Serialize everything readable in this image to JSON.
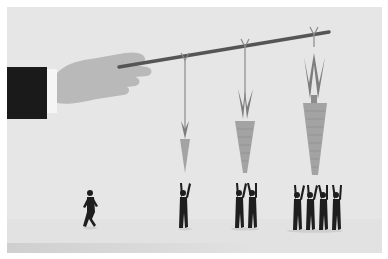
{
  "illustration": {
    "description": "Hand holding a stick with three carrots of increasing size dangling from strings; groups of 1, 2, and 4 businessmen reach up toward them while one man walks alone",
    "colors": {
      "background": "#e6e6e6",
      "floor": "#e2e2e2",
      "sleeve": "#1a1a1a",
      "cuff": "#f5f5f5",
      "hand": "#b9b9b9",
      "stick": "#555555",
      "string": "#8a8a8a",
      "carrot": "#a3a3a3",
      "carrot_leaves": "#7d7d7d",
      "figures": "#1e1e1e"
    },
    "carrots": [
      {
        "size": "small",
        "people_reaching": 1
      },
      {
        "size": "medium",
        "people_reaching": 2
      },
      {
        "size": "large",
        "people_reaching": 4
      }
    ],
    "walking_figures": 1
  }
}
